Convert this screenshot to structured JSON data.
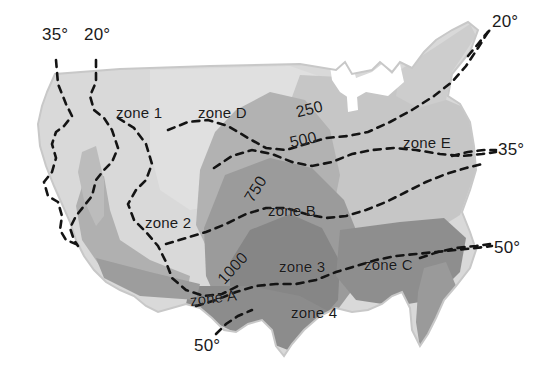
{
  "figure": {
    "kind": "shaded-contour-map",
    "region": "United States (contiguous)",
    "background_color": "#ffffff",
    "outline_color": "#cfcfcf"
  },
  "shading": {
    "levels": [
      {
        "name": "lightest",
        "color": "#d9d9d9"
      },
      {
        "name": "light",
        "color": "#cdcdcd"
      },
      {
        "name": "light-medium",
        "color": "#bdbdbd"
      },
      {
        "name": "medium",
        "color": "#ababab"
      },
      {
        "name": "medium-dark",
        "color": "#949494"
      },
      {
        "name": "dark",
        "color": "#848484"
      },
      {
        "name": "darkest",
        "color": "#777777"
      }
    ]
  },
  "contours": {
    "line_color": "#141414",
    "style": "dashed",
    "isoline_labels": [
      {
        "id": "iso-250",
        "text": "250",
        "x": 296,
        "y": 110
      },
      {
        "id": "iso-500",
        "text": "500",
        "x": 289,
        "y": 140
      },
      {
        "id": "iso-750",
        "text": "750",
        "x": 243,
        "y": 205
      },
      {
        "id": "iso-1000",
        "text": "1000",
        "x": 216,
        "y": 285
      }
    ],
    "degree_labels": [
      {
        "id": "deg-35-topleft",
        "text": "35°",
        "x": 42,
        "y": 35
      },
      {
        "id": "deg-20-topleft",
        "text": "20°",
        "x": 84,
        "y": 35
      },
      {
        "id": "deg-20-topright",
        "text": "20°",
        "x": 496,
        "y": 22
      },
      {
        "id": "deg-35-right",
        "text": "35°",
        "x": 500,
        "y": 150
      },
      {
        "id": "deg-50-right",
        "text": "50°",
        "x": 497,
        "y": 247
      },
      {
        "id": "deg-50-bottom",
        "text": "50°",
        "x": 196,
        "y": 344
      }
    ]
  },
  "zones": {
    "numeric": [
      {
        "id": "zone-1",
        "text": "zone 1",
        "x": 118,
        "y": 105
      },
      {
        "id": "zone-2",
        "text": "zone 2",
        "x": 146,
        "y": 215
      },
      {
        "id": "zone-3",
        "text": "zone 3",
        "x": 280,
        "y": 259
      },
      {
        "id": "zone-4",
        "text": "zone 4",
        "x": 292,
        "y": 306
      }
    ],
    "lettered": [
      {
        "id": "zone-A",
        "text": "zone A",
        "x": 191,
        "y": 294
      },
      {
        "id": "zone-B",
        "text": "zone B",
        "x": 269,
        "y": 204
      },
      {
        "id": "zone-C",
        "text": "zone C",
        "x": 366,
        "y": 258
      },
      {
        "id": "zone-D",
        "text": "zone D",
        "x": 199,
        "y": 105
      },
      {
        "id": "zone-E",
        "text": "zone E",
        "x": 404,
        "y": 135
      }
    ]
  }
}
